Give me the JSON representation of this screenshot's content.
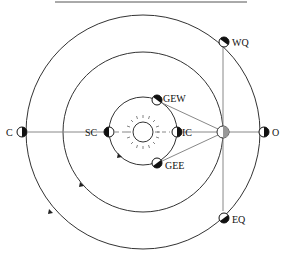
{
  "diagram": {
    "colors": {
      "orbit": "#333333",
      "line": "#888888",
      "ink": "#111111",
      "earth": "#999999"
    },
    "labels": {
      "conjunction": "C",
      "superior_conjunction": "SC",
      "inferior_conjunction": "IC",
      "greatest_eastern_elongation": "GEE",
      "greatest_western_elongation": "GEW",
      "opposition": "O",
      "western_quadrature": "WQ",
      "eastern_quadrature": "EQ"
    },
    "bodies": {
      "sun": "sun-icon",
      "earth": "earth-icon"
    },
    "orbits": [
      "inferior-planet-orbit",
      "earth-orbit",
      "superior-planet-orbit"
    ]
  }
}
